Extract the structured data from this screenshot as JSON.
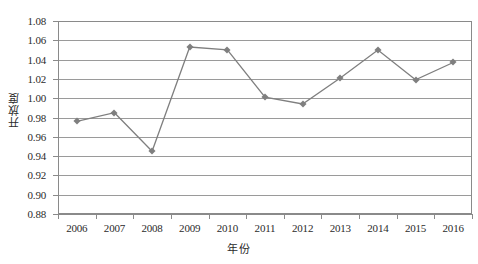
{
  "chart_data": {
    "type": "line",
    "title": "",
    "subtitle": "",
    "xlabel": "年份",
    "ylabel": "开放度",
    "categories": [
      "2006",
      "2007",
      "2008",
      "2009",
      "2010",
      "2011",
      "2012",
      "2013",
      "2014",
      "2015",
      "2016"
    ],
    "values": [
      0.976,
      0.985,
      0.945,
      1.053,
      1.05,
      1.001,
      0.994,
      1.021,
      1.05,
      1.019,
      1.037
    ],
    "series": [
      {
        "name": "开放度",
        "values": [
          0.976,
          0.985,
          0.945,
          1.053,
          1.05,
          1.001,
          0.994,
          1.021,
          1.05,
          1.019,
          1.037
        ]
      }
    ],
    "ylim": [
      0.88,
      1.08
    ],
    "ytick_step": 0.02,
    "ytick_labels": [
      "1.08",
      "1.06",
      "1.04",
      "1.02",
      "1.00",
      "0.98",
      "0.96",
      "0.94",
      "0.92",
      "0.90",
      "0.88"
    ],
    "ytick_values": [
      1.08,
      1.06,
      1.04,
      1.02,
      1.0,
      0.98,
      0.96,
      0.94,
      0.92,
      0.9,
      0.88
    ],
    "grid": true,
    "grid_axis": "y",
    "legend": false,
    "legend_position": "none",
    "annotations": [],
    "colors": {
      "line": "#7f7f7f",
      "marker": "#7f7f7f",
      "grid": "#9a9a9a",
      "axis": "#8a8a8a",
      "text": "#2b2b2b",
      "background": "#ffffff"
    },
    "marker_shape": "diamond"
  }
}
